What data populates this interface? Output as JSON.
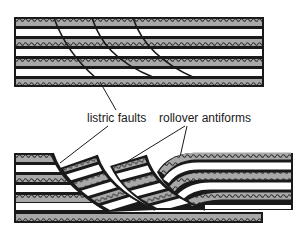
{
  "figure": {
    "type": "geologic-cross-section",
    "colors": {
      "background": "#ffffff",
      "outline": "#1a1a1a",
      "patterned_bed": "#a8a8a8",
      "pattern_wave": "#333333",
      "plain_bed": "#ffffff"
    },
    "top_panel": {
      "description": "undeformed layered strata with listric fault traces",
      "bed_sequence": [
        "patterned",
        "plain",
        "patterned",
        "plain",
        "patterned",
        "plain",
        "patterned"
      ]
    },
    "bottom_panel": {
      "description": "extended strata with rotated fault blocks and rollover antiform"
    },
    "labels": {
      "listric_faults": "listric faults",
      "rollover_antiforms": "rollover antiforms"
    }
  }
}
